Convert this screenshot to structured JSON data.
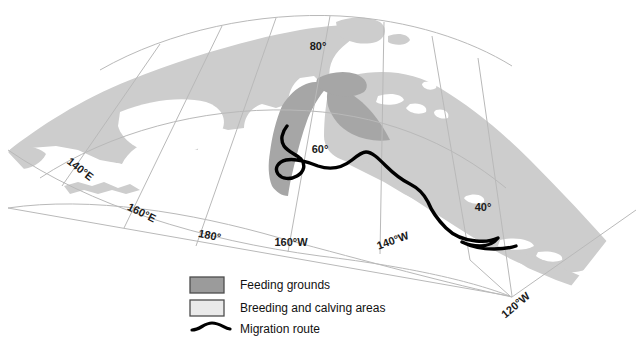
{
  "map": {
    "title": "Gray whale distribution and migration map of the North Pacific",
    "projection_note": "polar-style conic graticule",
    "colors": {
      "background": "#ffffff",
      "breeding_area_fill": "#cdcdcd",
      "feeding_area_fill": "#a6a6a6",
      "graticule_line": "#b9b9b9",
      "migration_route": "#000000",
      "label_text": "#1a1a1a",
      "legend_border": "#4d4d4d"
    },
    "graticule": {
      "latitude_labels": [
        {
          "text": "80°",
          "x": 318,
          "y": 50,
          "rotate": 0
        },
        {
          "text": "60°",
          "x": 320,
          "y": 153,
          "rotate": 0
        },
        {
          "text": "40°",
          "x": 483,
          "y": 211,
          "rotate": 0
        }
      ],
      "longitude_labels": [
        {
          "text": "140°E",
          "x": 78,
          "y": 172,
          "rotate": 38
        },
        {
          "text": "160°E",
          "x": 140,
          "y": 216,
          "rotate": 26
        },
        {
          "text": "180°",
          "x": 209,
          "y": 239,
          "rotate": 12
        },
        {
          "text": "160°W",
          "x": 291,
          "y": 246,
          "rotate": 0
        },
        {
          "text": "140°W",
          "x": 394,
          "y": 244,
          "rotate": -20
        },
        {
          "text": "120°W",
          "x": 518,
          "y": 308,
          "rotate": -40
        }
      ]
    },
    "legend": {
      "items": [
        {
          "symbol": "filled-swatch-dark",
          "label": "Feeding grounds",
          "swatch_fill": "#9b9b9b"
        },
        {
          "symbol": "filled-swatch-light",
          "label": "Breeding and calving areas",
          "swatch_fill": "#eaeaea"
        },
        {
          "symbol": "curved-line",
          "label": "Migration route",
          "swatch_fill": "#000000"
        }
      ]
    }
  }
}
